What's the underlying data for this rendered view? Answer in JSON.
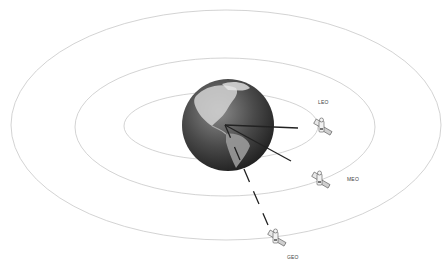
{
  "diagram": {
    "center": {
      "x": 226,
      "y": 126
    },
    "earth": {
      "cx": 228,
      "cy": 125,
      "r": 46
    },
    "orbits": [
      {
        "name": "LEO",
        "rx": 97,
        "ry": 34
      },
      {
        "name": "MEO",
        "rx": 150,
        "ry": 69
      },
      {
        "name": "GEO",
        "rx": 215,
        "ry": 115
      }
    ],
    "satellites": [
      {
        "id": "leo",
        "label": "LEO",
        "x": 322,
        "y": 127,
        "label_x": 318,
        "label_y": 99,
        "line_end": {
          "x": 298,
          "y": 128
        },
        "dashed": false
      },
      {
        "id": "meo",
        "label": "MEO",
        "x": 320,
        "y": 180,
        "label_x": 347,
        "label_y": 176,
        "line_end": {
          "x": 291,
          "y": 161
        },
        "dashed": false
      },
      {
        "id": "geo",
        "label": "GEO",
        "x": 276,
        "y": 238,
        "label_x": 287,
        "label_y": 254,
        "line_end": {
          "x": 268,
          "y": 225
        },
        "dashed": true
      }
    ],
    "colors": {
      "orbit": "#c8c8c8",
      "line": "#222222",
      "earth_dark": "#2a2a2a",
      "earth_light": "#bdbdbd"
    }
  }
}
